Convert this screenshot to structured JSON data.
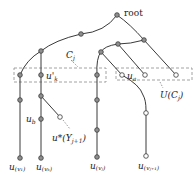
{
  "diagram": {
    "labels": {
      "root": "root",
      "cj": "C",
      "cj_sub": "j",
      "uk": "u'",
      "uk_sub": "k",
      "ua": "u",
      "ua_sub": "a",
      "ucj": "U(C",
      "ucj_sub": "j",
      "ucj_close": ")",
      "ub": "u",
      "ub_sub": "b",
      "ustar": "u*(Y",
      "ustar_sub": "j+1",
      "ustar_close": ")",
      "leaf1": "u",
      "leaf1_sub": "(v₁)",
      "leaf2": "u",
      "leaf2_sub": "(vₖ)",
      "leaf3": "u",
      "leaf3_sub": "(vⱼ)",
      "leaf4": "u",
      "leaf4_sub": "(vⱼ₊₁)"
    },
    "colors": {
      "edge": "#3a3a3a",
      "filled_node": "#8f8f8f",
      "hollow_node": "#ffffff",
      "box": "#8a8a8a"
    }
  }
}
